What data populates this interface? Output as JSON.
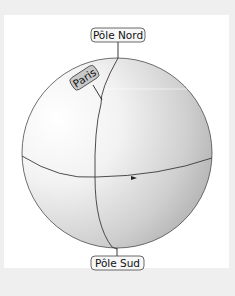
{
  "diagram": {
    "labels": {
      "north_pole": "Pôle Nord",
      "south_pole": "Pôle Sud",
      "city": "Paris"
    },
    "elements": {
      "sphere": "globe",
      "meridian": "Paris meridian line",
      "equator": "equator with rotation arrow"
    },
    "colors": {
      "page_background": "#efefef",
      "panel_background": "#ffffff",
      "sphere_light": "#fbfbfb",
      "sphere_dark": "#a9a9a9",
      "outline": "#444444",
      "label_fill": "#f4f4f4",
      "paris_label_fill": "#c9c9c9"
    }
  }
}
